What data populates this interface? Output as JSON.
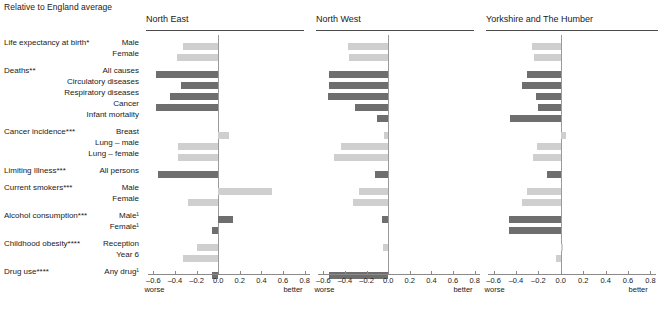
{
  "caption": "Relative to England average",
  "axis": {
    "ticks": [
      -0.6,
      -0.4,
      -0.2,
      0.0,
      0.2,
      0.4,
      0.6,
      0.8
    ],
    "tick_labels": [
      "–0.6",
      "–0.4",
      "–0.2",
      "0.0",
      "0.2",
      "0.4",
      "0.6",
      "0.8"
    ],
    "left_end_label": "worse",
    "right_end_label": "better",
    "min": -0.7,
    "max": 0.9
  },
  "colors": {
    "light_bar": "#cfcfcf",
    "dark_bar": "#6e6e6e",
    "zero_line": "#9a9a9a",
    "axis": "#8a8a8a",
    "text": "#1a1a1a"
  },
  "groups": [
    {
      "title": "Life expectancy at birth*",
      "rows": [
        "Male",
        "Female"
      ]
    },
    {
      "title": "Deaths**",
      "rows": [
        "All causes",
        "Circulatory diseases",
        "Respiratory diseases",
        "Cancer",
        "Infant mortality"
      ]
    },
    {
      "title": "Cancer incidence***",
      "rows": [
        "Breast",
        "Lung – male",
        "Lung – female"
      ]
    },
    {
      "title": "Limiting Illness***",
      "rows": [
        "All persons"
      ]
    },
    {
      "title": "Current smokers***",
      "rows": [
        "Male",
        "Female"
      ]
    },
    {
      "title": "Alcohol consumption***",
      "rows": [
        "Male¹",
        "Female¹"
      ]
    },
    {
      "title": "Childhood obesity****",
      "rows": [
        "Reception",
        "Year 6"
      ]
    },
    {
      "title": "Drug use****",
      "rows": [
        "Any drug¹"
      ]
    }
  ],
  "chart_data": {
    "type": "bar",
    "title": "Relative to England average",
    "orientation": "horizontal",
    "xlabel": "",
    "ylabel": "",
    "xlim": [
      -0.7,
      0.9
    ],
    "grid": false,
    "legend": null,
    "categories": [
      "Life expectancy at birth* – Male",
      "Life expectancy at birth* – Female",
      "Deaths** – All causes",
      "Deaths** – Circulatory diseases",
      "Deaths** – Respiratory diseases",
      "Deaths** – Cancer",
      "Deaths** – Infant mortality",
      "Cancer incidence*** – Breast",
      "Cancer incidence*** – Lung – male",
      "Cancer incidence*** – Lung – female",
      "Limiting Illness*** – All persons",
      "Current smokers*** – Male",
      "Current smokers*** – Female",
      "Alcohol consumption*** – Male¹",
      "Alcohol consumption*** – Female¹",
      "Childhood obesity**** – Reception",
      "Childhood obesity**** – Year 6",
      "Drug use**** – Any drug¹"
    ],
    "shades": [
      "light",
      "light",
      "dark",
      "dark",
      "dark",
      "dark",
      "dark",
      "light",
      "light",
      "light",
      "dark",
      "light",
      "light",
      "dark",
      "dark",
      "light",
      "light",
      "dark"
    ],
    "panels": [
      {
        "name": "North East",
        "values": [
          -0.33,
          -0.38,
          -0.58,
          -0.34,
          -0.45,
          -0.58,
          0.0,
          0.1,
          -0.37,
          -0.37,
          -0.56,
          0.5,
          -0.28,
          0.14,
          -0.06,
          -0.2,
          -0.33,
          -0.06
        ]
      },
      {
        "name": "North West",
        "values": [
          -0.37,
          -0.36,
          -0.55,
          -0.55,
          -0.56,
          -0.31,
          -0.1,
          -0.04,
          -0.44,
          -0.5,
          -0.12,
          -0.27,
          -0.33,
          -0.06,
          0.0,
          -0.05,
          0.0,
          -0.55
        ]
      },
      {
        "name": "Yorkshire and The Humber",
        "values": [
          -0.26,
          -0.24,
          -0.3,
          -0.35,
          -0.22,
          -0.2,
          -0.45,
          0.05,
          -0.21,
          -0.25,
          -0.12,
          -0.3,
          -0.35,
          -0.46,
          -0.46,
          0.02,
          -0.04,
          0.0
        ]
      }
    ]
  }
}
